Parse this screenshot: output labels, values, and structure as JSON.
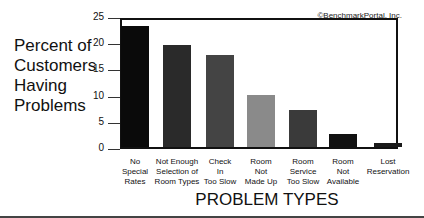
{
  "chart_data": {
    "type": "bar",
    "title": "",
    "xlabel": "PROBLEM TYPES",
    "ylabel": "Percent of Customers Having Problems",
    "ylabel_lines": [
      "Percent of",
      "Customers",
      "Having",
      "Problems"
    ],
    "ylim": [
      0,
      25
    ],
    "yticks": [
      0,
      5,
      10,
      15,
      20,
      25
    ],
    "categories": [
      "No Special Rates",
      "Not Enough Selection of Room Types",
      "Check In Too Slow",
      "Room Not Made Up",
      "Room Service Too Slow",
      "Room Not Available",
      "Lost Reservation"
    ],
    "category_lines": [
      [
        "No",
        "Special",
        "Rates"
      ],
      [
        "Not Enough",
        "Selection of",
        "Room Types"
      ],
      [
        "Check",
        "In",
        "Too Slow"
      ],
      [
        "Room",
        "Not",
        "Made Up"
      ],
      [
        "Room",
        "Service",
        "Too Slow"
      ],
      [
        "Room",
        "Not",
        "Available"
      ],
      [
        "Lost",
        "Reservation"
      ]
    ],
    "values": [
      23,
      19.5,
      17.5,
      10,
      7,
      2.5,
      0.7
    ],
    "bar_colors": [
      "#0a0a0a",
      "#2a2a2a",
      "#444444",
      "#8a8a8a",
      "#3a3a3a",
      "#111111",
      "#1a1a1a"
    ],
    "grid": false,
    "legend": null,
    "annotation": "©BenchmarkPortal, Inc."
  },
  "labels": {
    "copyright": "©BenchmarkPortal, Inc.",
    "x_title": "PROBLEM TYPES",
    "y_lines": [
      "Percent of",
      "Customers",
      "Having",
      "Problems"
    ],
    "ticks": [
      "25",
      "20",
      "15",
      "10",
      "5",
      "0"
    ]
  }
}
